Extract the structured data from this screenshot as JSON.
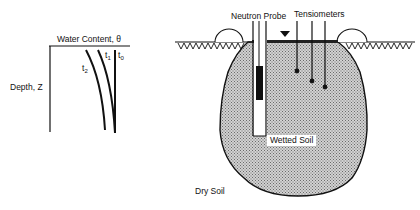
{
  "left_plot": {
    "x_axis_label": "Water Content, θ",
    "y_axis_label": "Depth, Z",
    "curves": [
      {
        "label": "t",
        "subscript": "0"
      },
      {
        "label": "t",
        "subscript": "1"
      },
      {
        "label": "t",
        "subscript": "2"
      }
    ]
  },
  "right_diagram": {
    "probe_label": "Neutron Probe",
    "tensiometers_label": "Tensiometers",
    "wetted_label": "Wetted Soil",
    "dry_label": "Dry Soil"
  },
  "colors": {
    "ink": "#111111",
    "wetted_fill": "#c4c4c4",
    "background": "#ffffff"
  }
}
